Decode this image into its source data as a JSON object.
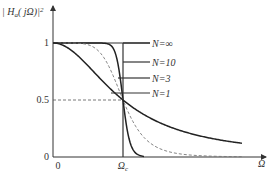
{
  "chart_data": {
    "type": "line",
    "title": "",
    "ylabel": "| H_a(jΩ) |²",
    "xlabel": "Ω",
    "x_ticks": [
      {
        "value": 0,
        "label": "0"
      },
      {
        "value": 1,
        "label": "Ωc"
      }
    ],
    "y_ticks": [
      {
        "value": 0,
        "label": "0"
      },
      {
        "value": 0.5,
        "label": "0.5"
      },
      {
        "value": 1,
        "label": "1"
      }
    ],
    "xlim": [
      0,
      3.2
    ],
    "ylim": [
      0,
      1.25
    ],
    "reference_lines": [
      {
        "type": "horizontal",
        "y": 0.5,
        "style": "dashed"
      },
      {
        "type": "horizontal",
        "y": 1.0,
        "style": "solid"
      }
    ],
    "series": [
      {
        "name": "N=∞",
        "order": null,
        "style": "solid",
        "description": "ideal brick-wall: 1 for Ω<Ωc, 0 for Ω>Ωc"
      },
      {
        "name": "N=10",
        "order": 10,
        "style": "solid"
      },
      {
        "name": "N=3",
        "order": 3,
        "style": "dashed"
      },
      {
        "name": "N=1",
        "order": 1,
        "style": "solid"
      }
    ],
    "legend": {
      "placement": "right",
      "entries": [
        "N=∞",
        "N=10",
        "N=3",
        "N=1"
      ]
    }
  }
}
